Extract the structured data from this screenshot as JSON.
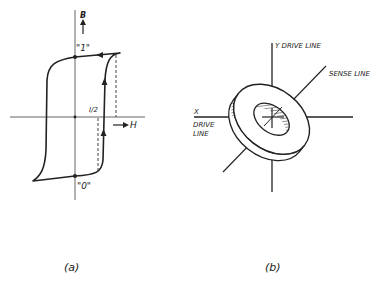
{
  "figure_a": {
    "caption": "(a)",
    "axis_vertical_label": "B",
    "axis_horizontal_label": "H",
    "state_one_label": "\"1\"",
    "state_zero_label": "\"0\"",
    "half_current_label": "I/2",
    "description": "Square hysteresis loop of a magnetic core"
  },
  "figure_b": {
    "caption": "(b)",
    "y_line_label": "Y DRIVE LINE",
    "x_label": "X",
    "x_line_label_1": "DRIVE",
    "x_line_label_2": "LINE",
    "sense_line_label": "SENSE LINE",
    "description": "Toroidal ferrite core threaded by X, Y drive lines and sense line"
  },
  "colors": {
    "ink": "#222222",
    "axis": "#555555",
    "background": "#ffffff"
  }
}
